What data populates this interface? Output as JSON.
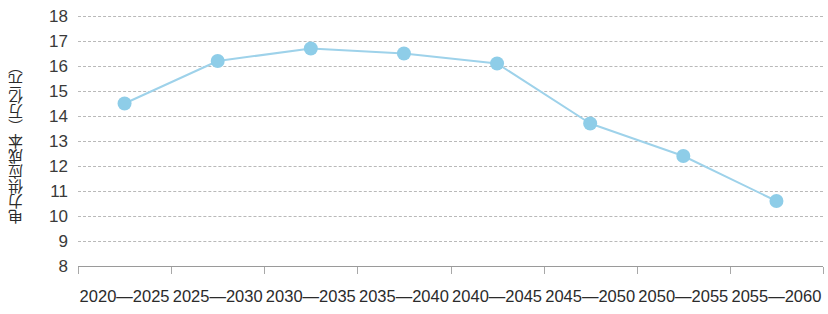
{
  "chart_data": {
    "type": "line",
    "title": "",
    "xlabel": "",
    "ylabel": "电力供应成本（万亿元）",
    "categories": [
      "2020—2025",
      "2025—2030",
      "2030—2035",
      "2035—2040",
      "2040—2045",
      "2045—2050",
      "2050—2055",
      "2055—2060"
    ],
    "values": [
      14.5,
      16.2,
      16.7,
      16.5,
      16.1,
      13.7,
      12.4,
      10.6
    ],
    "ylim": [
      8,
      18
    ],
    "ytick_labels": [
      "18",
      "17",
      "16",
      "15",
      "14",
      "13",
      "12",
      "11",
      "10",
      "9",
      "8"
    ],
    "ytick_values": [
      18,
      17,
      16,
      15,
      14,
      13,
      12,
      11,
      10,
      9,
      8
    ],
    "grid": true,
    "grid_axis": "y",
    "legend": "none",
    "series_color": "#8ecde8",
    "line_color": "#9ed2ea",
    "marker_color": "#8ecde8",
    "grid_color": "#b9b9b9",
    "axis_color": "#9a9a9a",
    "text_color": "#2b2b2b"
  }
}
